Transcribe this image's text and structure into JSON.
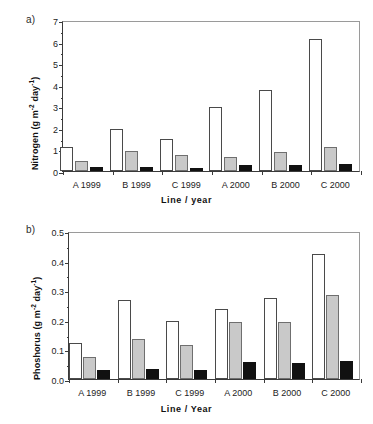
{
  "figure": {
    "panel_a_tag": "a)",
    "panel_b_tag": "b)"
  },
  "chart_data": [
    {
      "type": "bar",
      "panel": "a",
      "title": "",
      "xlabel": "Line / year",
      "ylabel": "Nitrogen (g m−2 day−1)",
      "ylabel_parts": {
        "pre": "Nitrogen (g m",
        "sup1": "-2",
        "mid": " day",
        "sup2": "-1",
        "post": ")"
      },
      "categories": [
        "A 1999",
        "B 1999",
        "C 1999",
        "A 2000",
        "B 2000",
        "C 2000"
      ],
      "ylim": [
        0,
        7
      ],
      "yticks": [
        0,
        1,
        2,
        3,
        4,
        5,
        6,
        7
      ],
      "ytick_labels": [
        "0",
        "1",
        "2",
        "3",
        "4",
        "5",
        "6",
        "7"
      ],
      "grid": false,
      "legend": "none",
      "series": [
        {
          "name": "white",
          "color": "#ffffff",
          "values": [
            1.1,
            1.93,
            1.48,
            2.97,
            3.75,
            6.1
          ]
        },
        {
          "name": "grey",
          "color": "#c9c9c9",
          "values": [
            0.45,
            0.91,
            0.72,
            0.66,
            0.88,
            1.12
          ]
        },
        {
          "name": "black",
          "color": "#111111",
          "values": [
            0.18,
            0.19,
            0.15,
            0.28,
            0.27,
            0.32
          ]
        }
      ]
    },
    {
      "type": "bar",
      "panel": "b",
      "title": "",
      "xlabel": "Line / Year",
      "ylabel": "Phoshorus (g m−2 day−1)",
      "ylabel_parts": {
        "pre": "Phoshorus (g m",
        "sup1": "-2",
        "mid": " day",
        "sup2": "-1",
        "post": ")"
      },
      "categories": [
        "A 1999",
        "B 1999",
        "C 1999",
        "A 2000",
        "B 2000",
        "C 2000"
      ],
      "ylim": [
        0.0,
        0.5
      ],
      "yticks": [
        0.0,
        0.1,
        0.2,
        0.3,
        0.4,
        0.5
      ],
      "ytick_labels": [
        "0.0",
        "0.1",
        "0.2",
        "0.3",
        "0.4",
        "0.5"
      ],
      "grid": false,
      "legend": "none",
      "series": [
        {
          "name": "white",
          "color": "#ffffff",
          "values": [
            0.12,
            0.268,
            0.196,
            0.235,
            0.274,
            0.424
          ]
        },
        {
          "name": "grey",
          "color": "#c9c9c9",
          "values": [
            0.075,
            0.134,
            0.115,
            0.192,
            0.191,
            0.283
          ]
        },
        {
          "name": "black",
          "color": "#111111",
          "values": [
            0.032,
            0.035,
            0.03,
            0.056,
            0.053,
            0.061
          ]
        }
      ]
    }
  ]
}
